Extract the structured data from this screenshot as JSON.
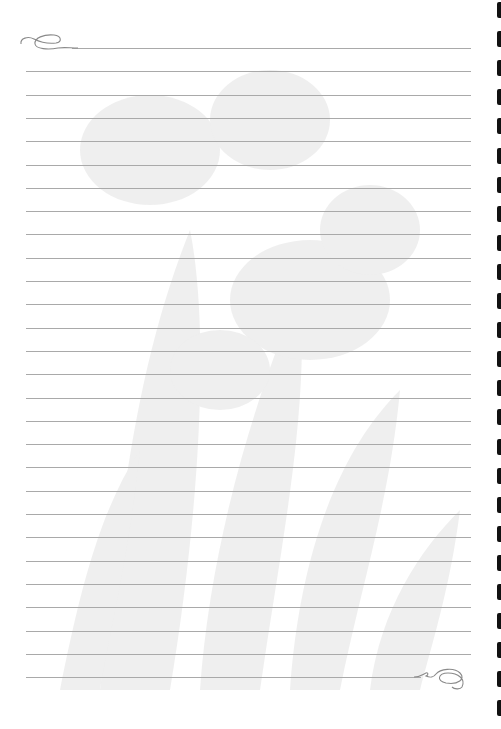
{
  "page": {
    "type": "lined-stationery",
    "background_color": "#ffffff",
    "rule_color": "#a9a9a9",
    "rule_count": 28,
    "rule_top": 48,
    "rule_spacing": 23.3,
    "watermark": "faded-iris-flowers"
  },
  "ornaments": {
    "top_left": "swirl-flourish-icon",
    "bottom_right": "swirl-flourish-icon"
  },
  "right_edge": {
    "glyph_count": 25,
    "glyph_top": 2,
    "glyph_spacing": 29.1,
    "color": "#111111"
  }
}
